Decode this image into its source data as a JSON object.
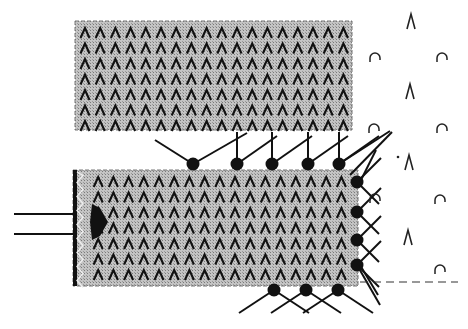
{
  "diagram": {
    "colors": {
      "background": "#ffffff",
      "block_fill": "#b8b8b8",
      "stipple_dark": "#8a8a8a",
      "ink": "#111111"
    },
    "blocks": [
      {
        "id": "upper-block",
        "x": 75,
        "y": 21,
        "w": 277,
        "h": 109
      },
      {
        "id": "lower-block",
        "x": 73,
        "y": 170,
        "w": 285,
        "h": 116
      }
    ],
    "input_arrows": [
      {
        "x1": 14,
        "y1": 214,
        "x2": 73,
        "y2": 214
      },
      {
        "x1": 14,
        "y1": 234,
        "x2": 73,
        "y2": 234
      }
    ],
    "receptors_top": [
      {
        "cx": 193,
        "cy": 164,
        "type": "v"
      },
      {
        "cx": 237,
        "cy": 164,
        "type": "stick"
      },
      {
        "cx": 272,
        "cy": 164,
        "type": "stick"
      },
      {
        "cx": 308,
        "cy": 164,
        "type": "stick"
      },
      {
        "cx": 339,
        "cy": 164,
        "type": "stick"
      }
    ],
    "receptors_right": [
      {
        "cx": 357,
        "cy": 182
      },
      {
        "cx": 357,
        "cy": 212
      },
      {
        "cx": 357,
        "cy": 240
      },
      {
        "cx": 357,
        "cy": 265
      }
    ],
    "receptors_bottom": [
      {
        "cx": 274,
        "cy": 290
      },
      {
        "cx": 306,
        "cy": 290
      },
      {
        "cx": 338,
        "cy": 290
      }
    ],
    "free_symbols": {
      "lambda": [
        {
          "x": 411,
          "y": 22,
          "label": "Λ"
        },
        {
          "x": 410,
          "y": 92,
          "label": "Λ"
        },
        {
          "x": 409,
          "y": 163,
          "label": "Λ"
        },
        {
          "x": 408,
          "y": 238,
          "label": "Λ"
        }
      ],
      "cap": [
        {
          "x": 375,
          "y": 58,
          "label": "∩"
        },
        {
          "x": 442,
          "y": 58,
          "label": "∩"
        },
        {
          "x": 374,
          "y": 129,
          "label": "∩"
        },
        {
          "x": 442,
          "y": 129,
          "label": "∩"
        },
        {
          "x": 375,
          "y": 199,
          "label": "∩"
        },
        {
          "x": 440,
          "y": 200,
          "label": "∩"
        },
        {
          "x": 440,
          "y": 270,
          "label": "∩"
        }
      ],
      "dot": {
        "x": 398,
        "y": 157
      }
    },
    "dashed_line": {
      "x1": 360,
      "y1": 282,
      "x2": 458,
      "y2": 282
    },
    "texture_glyph": "Λ"
  }
}
